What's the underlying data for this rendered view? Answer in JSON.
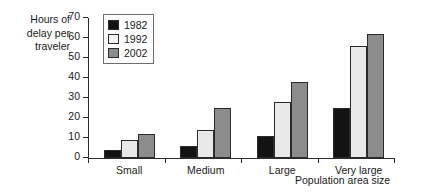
{
  "chart_data": {
    "type": "bar",
    "title": "",
    "subtitle": "",
    "xlabel": "Population area size",
    "ylabel": "Hours of\ndelay per\ntraveler",
    "categories": [
      "Small",
      "Medium",
      "Large",
      "Very large"
    ],
    "series": [
      {
        "name": "1982",
        "values": [
          4,
          6,
          11,
          25
        ],
        "color": "#131313"
      },
      {
        "name": "1992",
        "values": [
          9,
          14,
          28,
          56
        ],
        "color": "#e9e9e9"
      },
      {
        "name": "2002",
        "values": [
          12,
          25,
          38,
          62
        ],
        "color": "#8c8c8c"
      }
    ],
    "ylim": [
      0,
      70
    ],
    "ytick_labels": [
      "70",
      "60",
      "50",
      "40",
      "30",
      "20",
      "10",
      "0"
    ],
    "ytick_values": [
      70,
      60,
      50,
      40,
      30,
      20,
      10,
      0
    ],
    "ytick_step": 10,
    "grid": false,
    "legend_position": "top-left-inside",
    "legend_entries": [
      "1982",
      "1992",
      "2002"
    ],
    "bar_border_color": "#2b2b2b",
    "axis_color": "#2b2b2b",
    "background": "#ffffff"
  }
}
